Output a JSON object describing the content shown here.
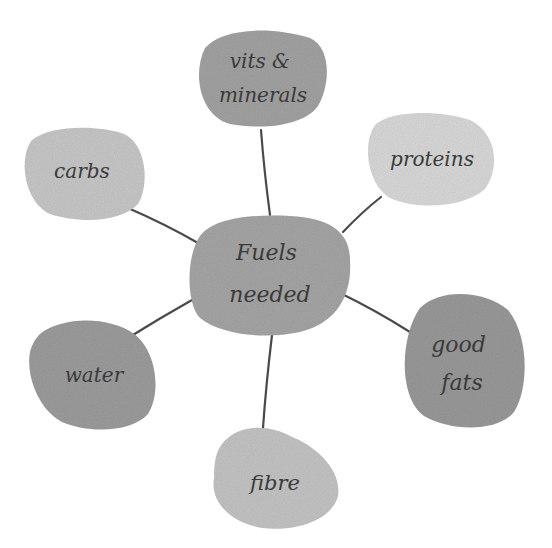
{
  "diagram": {
    "type": "mind-map",
    "background": "#ffffff",
    "line_color": "#4a4a4a",
    "center": {
      "id": "fuels-needed",
      "lines": [
        "Fuels",
        "needed"
      ],
      "fill": "#a6a6a6"
    },
    "nodes": [
      {
        "id": "vits-minerals",
        "lines": [
          "vits &",
          "minerals"
        ],
        "fill": "#a3a3a3"
      },
      {
        "id": "proteins",
        "lines": [
          "proteins"
        ],
        "fill": "#d9d9d9"
      },
      {
        "id": "good-fats",
        "lines": [
          "good",
          "fats"
        ],
        "fill": "#9a9a9a"
      },
      {
        "id": "fibre",
        "lines": [
          "fibre"
        ],
        "fill": "#c4c4c4"
      },
      {
        "id": "water",
        "lines": [
          "water"
        ],
        "fill": "#9d9d9d"
      },
      {
        "id": "carbs",
        "lines": [
          "carbs"
        ],
        "fill": "#c8c8c8"
      }
    ]
  }
}
